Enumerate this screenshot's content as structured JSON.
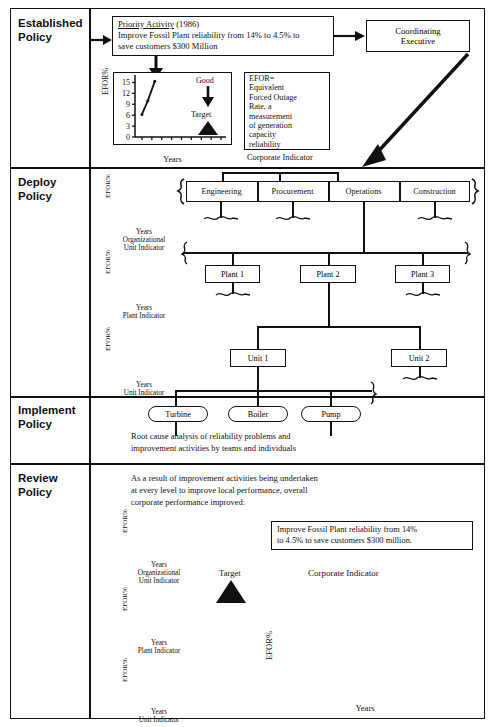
{
  "sections": [
    {
      "id": "established",
      "label": "Established\nPolicy",
      "label_line1": "Established",
      "label_line2": "Policy"
    },
    {
      "id": "deploy",
      "label_line1": "Deploy",
      "label_line2": "Policy"
    },
    {
      "id": "implement",
      "label_line1": "Implement",
      "label_line2": "Policy"
    },
    {
      "id": "review",
      "label_line1": "Review",
      "label_line2": "Policy"
    }
  ],
  "established": {
    "priority_box": {
      "title": "Priority Activity",
      "year": " (1986)",
      "line1": "Improve Fossil Plant reliability from 14% to 4.5% to",
      "line2": "save customers $300 Million"
    },
    "coordinating_executive": {
      "line1": "Coordinating",
      "line2": "Executive"
    },
    "efor_definition": "EFOR=\nEquivalent\nForced Outage\nRate, a\nmeasurement\nof generation\ncapacity\nreliability",
    "efor_lines": [
      "EFOR=",
      "Equivalent",
      "Forced Outage",
      "Rate, a",
      "measurement",
      "of generation",
      "capacity",
      "reliability"
    ],
    "corporate_indicator_caption": "Corporate Indicator",
    "good_label": "Good",
    "target_label": "Target"
  },
  "deploy": {
    "org_units": [
      "Engineering",
      "Procurement",
      "Operations",
      "Construction"
    ],
    "plants": [
      "Plant 1",
      "Plant 2",
      "Plant 3"
    ],
    "units": [
      "Unit 1",
      "Unit 2"
    ],
    "mini_charts": [
      {
        "ylabel": "EFOR%",
        "xlabel": "Years",
        "caption_line1": "Organizational",
        "caption_line2": "Unit Indicator"
      },
      {
        "ylabel": "EFOR%",
        "xlabel": "Years",
        "caption_line1": "Plant Indicator",
        "caption_line2": ""
      },
      {
        "ylabel": "EFOR%",
        "xlabel": "Years",
        "caption_line1": "Unit Indicator",
        "caption_line2": ""
      }
    ]
  },
  "implement": {
    "components": [
      "Turbine",
      "Boiler",
      "Pump"
    ],
    "note_line1": "Root cause analysis of reliability problems and",
    "note_line2": "improvement activities by teams and individuals"
  },
  "review": {
    "intro_line1": "As a result of improvement activities being undertaken",
    "intro_line2": "at every level to improve local performance, overall",
    "intro_line3": "corporate performance improved:",
    "result_box_line1": "Improve Fossil Plant reliability from 14%",
    "result_box_line2": "to 4.5% to save customers $300 million.",
    "target_label": "Target",
    "corporate_indicator_title": "Corporate Indicator",
    "mini_charts": [
      {
        "ylabel": "EFOR%",
        "xlabel": "Years",
        "caption_line1": "Organizational",
        "caption_line2": "Unit Indicator"
      },
      {
        "ylabel": "EFOR%",
        "xlabel": "Years",
        "caption_line1": "Plant Indicator",
        "caption_line2": ""
      },
      {
        "ylabel": "EFOR%",
        "xlabel": "Years",
        "caption_line1": "Unit Indicator",
        "caption_line2": ""
      }
    ]
  },
  "chart_data": [
    {
      "id": "top_corporate_indicator",
      "type": "line",
      "title": "Corporate Indicator",
      "xlabel": "Years",
      "ylabel": "EFOR%",
      "ylim": [
        0,
        16.5
      ],
      "yticks": [
        0,
        3,
        6,
        9,
        12,
        15
      ],
      "ytick_labels": [
        "0",
        "3",
        "6",
        "9",
        "12",
        "15"
      ],
      "xticks": [
        "'84",
        "'85",
        "'86",
        "'87",
        "'88",
        "'89",
        "'90",
        "'91",
        "'92"
      ],
      "x": [
        1984,
        1984.6,
        1985.3
      ],
      "values": [
        6.2,
        10.0,
        15.3
      ],
      "target_marker": {
        "x": 1991,
        "y": 3.2,
        "label": "Target"
      },
      "good_arrow": {
        "label": "Good",
        "direction": "down"
      },
      "grid": false,
      "framed": true
    },
    {
      "id": "bottom_corporate_indicator",
      "type": "line",
      "title": "Corporate Indicator",
      "xlabel": "Years",
      "ylabel": "EFOR%",
      "ylim": [
        0,
        16.5
      ],
      "yticks": [
        0,
        3,
        6,
        9,
        12,
        15
      ],
      "ytick_labels": [
        "0",
        "3",
        "6",
        "9",
        "12",
        "15"
      ],
      "xticks": [
        "'84",
        "'85",
        "'86",
        "'87",
        "'88",
        "'89",
        "'90",
        "'91",
        "'92"
      ],
      "x": [
        1983.5,
        1984.0,
        1984.5,
        1985.0,
        1985.45,
        1985.9,
        1986.4,
        1987.0,
        1988.0,
        1989.0,
        1989.85,
        1990.5,
        1991.0,
        1992.0
      ],
      "values": [
        7.2,
        8.0,
        8.8,
        11.0,
        15.3,
        11.6,
        10.2,
        9.0,
        7.4,
        5.0,
        2.5,
        3.0,
        3.7,
        2.1
      ],
      "target_marker": {
        "x": 1992,
        "y": 4.5,
        "label": "Target"
      },
      "grid": false,
      "framed": false
    },
    {
      "id": "deploy_org_unit_indicator",
      "type": "line",
      "ylabel": "EFOR%",
      "xlabel": "Years",
      "caption": "Organizational Unit Indicator",
      "x": [
        0,
        0.12,
        0.22,
        0.3,
        0.42,
        0.5,
        0.62,
        0.78,
        1.0
      ],
      "values": [
        0.18,
        0.3,
        0.34,
        0.46,
        0.5,
        0.62,
        0.7,
        0.82,
        0.95
      ],
      "target_marker": {
        "x": 1.25,
        "y": 0.22
      }
    },
    {
      "id": "deploy_plant_indicator",
      "type": "line",
      "ylabel": "EFOR%",
      "xlabel": "Years",
      "caption": "Plant Indicator",
      "x": [
        0,
        0.12,
        0.24,
        0.34,
        0.46,
        0.58,
        0.72,
        0.88,
        1.0
      ],
      "values": [
        0.16,
        0.26,
        0.32,
        0.44,
        0.48,
        0.6,
        0.68,
        0.76,
        0.88
      ],
      "target_marker": {
        "x": 1.25,
        "y": 0.2
      }
    },
    {
      "id": "deploy_unit_indicator",
      "type": "line",
      "ylabel": "EFOR%",
      "xlabel": "Years",
      "caption": "Unit Indicator",
      "x": [
        0,
        0.14,
        0.26,
        0.36,
        0.5,
        0.62,
        0.76,
        0.9,
        1.0
      ],
      "values": [
        0.2,
        0.3,
        0.36,
        0.46,
        0.52,
        0.64,
        0.7,
        0.78,
        0.84
      ],
      "target_marker": {
        "x": 1.25,
        "y": 0.18
      }
    },
    {
      "id": "review_org_unit_indicator",
      "type": "line",
      "ylabel": "EFOR%",
      "xlabel": "Years",
      "caption": "Organizational Unit Indicator",
      "x": [
        0,
        0.08,
        0.18,
        0.28,
        0.36,
        0.48,
        0.6,
        0.72,
        0.84,
        1.0
      ],
      "values": [
        0.3,
        0.28,
        0.46,
        0.52,
        0.76,
        0.82,
        0.8,
        0.78,
        0.62,
        0.42
      ],
      "target_marker": {
        "x": 1.12,
        "y": 0.3
      }
    },
    {
      "id": "review_plant_indicator",
      "type": "line",
      "ylabel": "EFOR%",
      "xlabel": "Years",
      "caption": "Plant Indicator",
      "x": [
        0,
        0.1,
        0.2,
        0.3,
        0.42,
        0.54,
        0.66,
        0.78,
        0.9,
        1.0
      ],
      "values": [
        0.3,
        0.2,
        0.48,
        0.56,
        0.5,
        0.6,
        0.52,
        0.42,
        0.38,
        0.22
      ],
      "target_marker": {
        "x": 1.12,
        "y": 0.36
      }
    },
    {
      "id": "review_unit_indicator",
      "type": "line",
      "ylabel": "EFOR%",
      "xlabel": "Years",
      "caption": "Unit Indicator",
      "x": [
        0,
        0.1,
        0.22,
        0.34,
        0.46,
        0.58,
        0.7,
        0.82,
        0.92,
        1.0
      ],
      "values": [
        0.22,
        0.38,
        0.56,
        0.62,
        0.56,
        0.62,
        0.56,
        0.5,
        0.52,
        0.2
      ],
      "target_marker": {
        "x": 1.1,
        "y": 0.1
      }
    }
  ],
  "colors": {
    "ink": "#111111",
    "paper": "#ffffff"
  }
}
